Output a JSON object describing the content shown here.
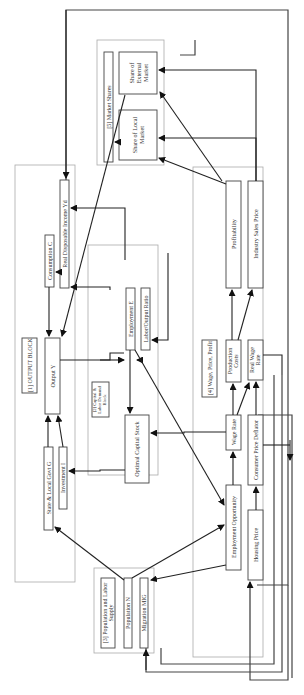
{
  "diagram": {
    "orientation": "rotated 90 degrees counter-clockwise (text reads bottom-to-top)",
    "blocks": {
      "output": "[1] OUTPUT BLOCK",
      "capital_labor": "[2] Capital & Labor Demand Block",
      "population": "[3] Population and Labor Supply",
      "wage_price": "[4] Wage, Price, Profit",
      "market_shares": "[5] Market Shares"
    },
    "nodes": {
      "share_external": "Share of External Market",
      "share_local": "Share of Local Market",
      "real_disposable_income": "Real Disposable Income Yd",
      "consumption": "Consumption C",
      "output_y": "Output Y",
      "state_local_govt": "State & Local Govt G",
      "investment": "Investment I",
      "employment": "Employment E",
      "labor_output_ratio": "Labor/Output Ratio",
      "optimal_capital_stock": "Optimal Capital Stock",
      "profitability": "Profitability",
      "industry_sales_price": "Industry Sales Price",
      "production_costs": "Production Costs",
      "real_wage_rate": "Real Wage Rate",
      "wage_rate": "Wage Rate",
      "consumer_price_deflator": "Consumer Price Deflator",
      "employment_opportunity": "Employment Opportunity",
      "housing_price": "Housing Price",
      "population_n": "Population N",
      "migration": "Migration MIG"
    },
    "colors": {
      "box_stroke": "#444444",
      "block_stroke": "#aaaaaa",
      "arrow": "#222222",
      "background": "#ffffff"
    }
  }
}
